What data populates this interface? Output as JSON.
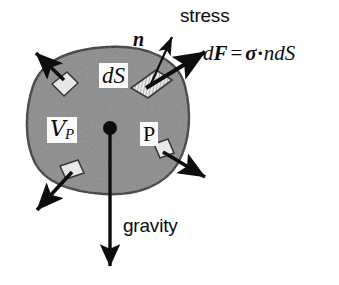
{
  "figure": {
    "background_color": "#ffffff",
    "ink_color": "#0d0d0d",
    "body_fill_color": "#8a8a8a",
    "body_outline_color": "#2b2b2b",
    "patch_fill_color": "#e8e8e8",
    "label_box_color": "#fbfbfb"
  },
  "labels": {
    "stress": "stress",
    "gravity": "gravity",
    "normal_vector": "n",
    "surface_element": "dS",
    "volume": "V",
    "volume_subscript": "P",
    "point": "P"
  },
  "equation": {
    "lhs_d": "d",
    "lhs_F": "F",
    "equals": "=",
    "sigma": "σ",
    "dot": "·",
    "n": "n",
    "dS": "dS",
    "full_text": "dF = σ·ndS"
  },
  "geometry": {
    "body_center_point": [
      110,
      128
    ],
    "body_bounds": [
      28,
      48,
      188,
      194
    ],
    "gravity_arrow": {
      "from": [
        110,
        128
      ],
      "to": [
        110,
        272
      ]
    },
    "normal_arrow": {
      "from": [
        146,
        82
      ],
      "to": [
        172,
        36
      ]
    },
    "force_arrow": {
      "from": [
        146,
        82
      ],
      "to": [
        206,
        50
      ]
    },
    "traction_arrows": [
      {
        "name": "upper-left",
        "from": [
          63,
          76
        ],
        "to": [
          36,
          52
        ]
      },
      {
        "name": "lower-left",
        "from": [
          72,
          168
        ],
        "to": [
          36,
          212
        ]
      },
      {
        "name": "right",
        "from": [
          162,
          152
        ],
        "to": [
          206,
          178
        ]
      }
    ]
  }
}
